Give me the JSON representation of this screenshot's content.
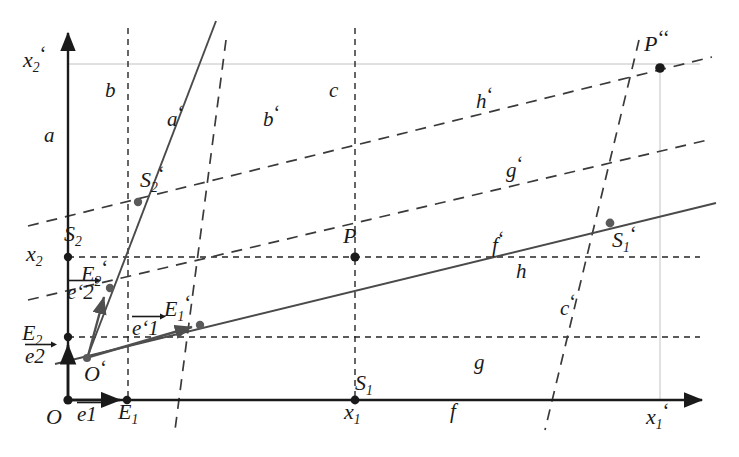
{
  "figure": {
    "type": "geometry-diagram",
    "background": "#ffffff",
    "ink": "#1a1a1a",
    "grey_ink": "#5a5a5a",
    "faint_ink": "#b9b9b9",
    "width": 739,
    "height": 457
  },
  "axes": {
    "x_axis": {
      "label": "x",
      "sub": "1",
      "prime": "‘",
      "from": [
        68,
        400
      ],
      "to": [
        710,
        400
      ]
    },
    "y_axis": {
      "label": "x",
      "sub": "2",
      "prime": "‘",
      "from": [
        68,
        400
      ],
      "to": [
        68,
        25
      ]
    }
  },
  "points": [
    {
      "name": "O",
      "label": "O",
      "sub": "",
      "prime": "",
      "x": 68,
      "y": 400,
      "dot": true,
      "lx": 46,
      "ly": 404
    },
    {
      "name": "E1",
      "label": "E",
      "sub": "1",
      "prime": "",
      "x": 127,
      "y": 400,
      "dot": true,
      "lx": 118,
      "ly": 404
    },
    {
      "name": "E2",
      "label": "E",
      "sub": "2",
      "prime": "",
      "x": 68,
      "y": 337,
      "dot": true,
      "lx": 24,
      "ly": 322
    },
    {
      "name": "x2",
      "label": "x",
      "sub": "2",
      "prime": "",
      "x": 68,
      "y": 257,
      "dot": true,
      "lx": 28,
      "ly": 245
    },
    {
      "name": "x2prime",
      "label": "x",
      "sub": "2",
      "prime": "‘",
      "x": 68,
      "y": 64,
      "dot": false,
      "lx": 25,
      "ly": 48
    },
    {
      "name": "x1",
      "label": "x",
      "sub": "1",
      "prime": "",
      "x": 355,
      "y": 400,
      "dot": true,
      "lx": 344,
      "ly": 404
    },
    {
      "name": "x1prime",
      "label": "x",
      "sub": "1",
      "prime": "‘",
      "x": 660,
      "y": 400,
      "dot": false,
      "lx": 648,
      "ly": 404
    },
    {
      "name": "Oprime",
      "label": "O",
      "sub": "",
      "prime": "‘",
      "x": 87,
      "y": 358,
      "dot": true,
      "lx": 84,
      "ly": 358
    },
    {
      "name": "E1prime",
      "label": "E",
      "sub": "1",
      "prime": "‘",
      "x": 200,
      "y": 325,
      "dot": true,
      "lx": 165,
      "ly": 297
    },
    {
      "name": "E2prime",
      "label": "E",
      "sub": "2",
      "prime": "‘",
      "x": 110,
      "y": 288,
      "dot": true,
      "lx": 83,
      "ly": 262
    },
    {
      "name": "S2",
      "label": "S",
      "sub": "2",
      "prime": "",
      "x": 68,
      "y": 257,
      "dot": true,
      "lx": 66,
      "ly": 227
    },
    {
      "name": "S2prime",
      "label": "S",
      "sub": "2",
      "prime": "‘",
      "x": 138,
      "y": 202,
      "dot": true,
      "lx": 141,
      "ly": 168
    },
    {
      "name": "S1",
      "label": "S",
      "sub": "1",
      "prime": "",
      "x": 355,
      "y": 400,
      "dot": true,
      "lx": 356,
      "ly": 375
    },
    {
      "name": "S1prime",
      "label": "S",
      "sub": "1",
      "prime": "‘",
      "x": 610,
      "y": 223,
      "dot": true,
      "lx": 613,
      "ly": 227
    },
    {
      "name": "P",
      "label": "P",
      "sub": "",
      "prime": "",
      "x": 355,
      "y": 257,
      "dot": true,
      "lx": 344,
      "ly": 228
    },
    {
      "name": "Pprime2",
      "label": "P",
      "sub": "",
      "prime": "‘‘",
      "x": 660,
      "y": 68,
      "dot": true,
      "lx": 646,
      "ly": 32
    }
  ],
  "lines": [
    {
      "name": "a",
      "label": "a",
      "prime": "",
      "style": "solid",
      "role": "y-axis",
      "lx": 45,
      "ly": 128
    },
    {
      "name": "b",
      "label": "b",
      "prime": "",
      "style": "dashed",
      "role": "vertical-through-E1",
      "lx": 107,
      "ly": 84
    },
    {
      "name": "c",
      "label": "c",
      "prime": "",
      "style": "dashed",
      "role": "vertical-through-x1",
      "lx": 330,
      "ly": 84
    },
    {
      "name": "f",
      "label": "f",
      "prime": "",
      "style": "solid",
      "role": "x-axis",
      "lx": 452,
      "ly": 404
    },
    {
      "name": "g",
      "label": "g",
      "prime": "",
      "style": "dashed",
      "role": "horizontal-through-E2",
      "lx": 476,
      "ly": 355
    },
    {
      "name": "h",
      "label": "h",
      "prime": "",
      "style": "dashed",
      "role": "horizontal-through-x2",
      "lx": 518,
      "ly": 264
    },
    {
      "name": "ap",
      "label": "a",
      "prime": "‘",
      "style": "solid",
      "role": "primed-y-axis",
      "lx": 168,
      "ly": 108
    },
    {
      "name": "bp",
      "label": "b",
      "prime": "‘",
      "style": "dashed",
      "role": "parallel-to-a-prime",
      "lx": 265,
      "ly": 108
    },
    {
      "name": "cp",
      "label": "c",
      "prime": "‘",
      "style": "dashed",
      "role": "parallel-to-a-prime",
      "lx": 562,
      "ly": 296
    },
    {
      "name": "fp",
      "label": "f",
      "prime": "‘",
      "style": "solid",
      "role": "primed-x-axis",
      "lx": 494,
      "ly": 233
    },
    {
      "name": "gp",
      "label": "g",
      "prime": "‘",
      "style": "dashed",
      "role": "parallel-to-f-prime",
      "lx": 508,
      "ly": 158
    },
    {
      "name": "hp",
      "label": "h",
      "prime": "‘",
      "style": "dashed",
      "role": "parallel-to-f-prime",
      "lx": 478,
      "ly": 90
    }
  ],
  "vectors": [
    {
      "name": "e1",
      "label": "e",
      "sub": "1",
      "prime": "",
      "from": [
        68,
        400
      ],
      "to": [
        127,
        400
      ],
      "lx": 78,
      "ly": 404
    },
    {
      "name": "e2",
      "label": "e",
      "sub": "2",
      "prime": "",
      "from": [
        68,
        400
      ],
      "to": [
        68,
        337
      ],
      "lx": 26,
      "ly": 345
    },
    {
      "name": "e1p",
      "label": "e",
      "sub": "1",
      "prime": "‘",
      "from": [
        87,
        358
      ],
      "to": [
        200,
        325
      ],
      "lx": 132,
      "ly": 330
    },
    {
      "name": "e2p",
      "label": "e",
      "sub": "2",
      "prime": "‘",
      "from": [
        87,
        358
      ],
      "to": [
        110,
        288
      ],
      "lx": 68,
      "ly": 294
    }
  ]
}
